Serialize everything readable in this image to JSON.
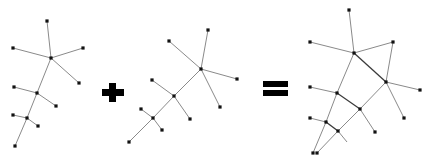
{
  "figure": {
    "operators": [
      {
        "symbol": "plus",
        "glyph": "+"
      },
      {
        "symbol": "equals",
        "glyph": "="
      }
    ],
    "colors": {
      "node": "#111111",
      "edge": "#8a8a8a",
      "strong_edge": "#3a3a3a",
      "operator": "#000000"
    },
    "graphs": [
      {
        "name": "tree-a",
        "nodes": [
          [
            47,
            21
          ],
          [
            13,
            48
          ],
          [
            83,
            48
          ],
          [
            51,
            58
          ],
          [
            79,
            83
          ],
          [
            14,
            87
          ],
          [
            37,
            93
          ],
          [
            56,
            106
          ],
          [
            13,
            115
          ],
          [
            27,
            118
          ],
          [
            38,
            126
          ],
          [
            15,
            146
          ]
        ],
        "edges": [
          [
            0,
            3
          ],
          [
            1,
            3
          ],
          [
            2,
            3
          ],
          [
            3,
            4
          ],
          [
            3,
            6
          ],
          [
            5,
            6
          ],
          [
            6,
            7
          ],
          [
            6,
            9
          ],
          [
            8,
            9
          ],
          [
            9,
            10
          ],
          [
            9,
            11
          ]
        ],
        "strong_edges": []
      },
      {
        "name": "tree-b",
        "nodes": [
          [
            208,
            30
          ],
          [
            169,
            41
          ],
          [
            201,
            69
          ],
          [
            237,
            79
          ],
          [
            152,
            80
          ],
          [
            220,
            107
          ],
          [
            174,
            96
          ],
          [
            190,
            119
          ],
          [
            141,
            109
          ],
          [
            153,
            118
          ],
          [
            162,
            130
          ],
          [
            129,
            142
          ]
        ],
        "edges": [
          [
            0,
            2
          ],
          [
            1,
            2
          ],
          [
            2,
            3
          ],
          [
            2,
            5
          ],
          [
            2,
            6
          ],
          [
            4,
            6
          ],
          [
            6,
            7
          ],
          [
            6,
            9
          ],
          [
            8,
            9
          ],
          [
            9,
            10
          ],
          [
            9,
            11
          ]
        ],
        "strong_edges": []
      },
      {
        "name": "merged-graph",
        "nodes": [
          [
            349,
            10
          ],
          [
            310,
            42
          ],
          [
            393,
            42
          ],
          [
            354,
            53
          ],
          [
            386,
            82
          ],
          [
            420,
            90
          ],
          [
            310,
            87
          ],
          [
            337,
            93
          ],
          [
            360,
            109
          ],
          [
            404,
            118
          ],
          [
            310,
            118
          ],
          [
            326,
            122
          ],
          [
            338,
            131
          ],
          [
            375,
            132
          ],
          [
            313,
            153
          ],
          [
            317,
            153
          ]
        ],
        "edges": [
          [
            0,
            3
          ],
          [
            1,
            3
          ],
          [
            2,
            3
          ],
          [
            2,
            4
          ],
          [
            4,
            5
          ],
          [
            4,
            9
          ],
          [
            4,
            8
          ],
          [
            3,
            7
          ],
          [
            6,
            7
          ],
          [
            7,
            8
          ],
          [
            8,
            13
          ],
          [
            8,
            12
          ],
          [
            7,
            11
          ],
          [
            10,
            11
          ],
          [
            11,
            12
          ],
          [
            11,
            14
          ],
          [
            12,
            15
          ]
        ],
        "strong_edges": [
          [
            3,
            4
          ],
          [
            7,
            8
          ],
          [
            11,
            12
          ]
        ],
        "open_edges": [
          [
            [
              338,
              131
            ],
            [
              347,
              142
            ]
          ]
        ]
      }
    ]
  }
}
